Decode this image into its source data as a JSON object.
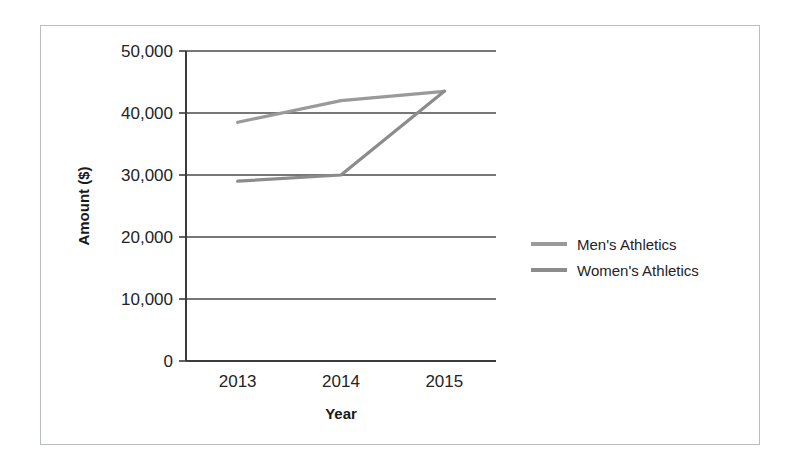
{
  "chart_data": {
    "type": "line",
    "title": "",
    "xlabel": "Year",
    "ylabel": "Amount ($)",
    "categories": [
      "2013",
      "2014",
      "2015"
    ],
    "xtick_labels": [
      "2013",
      "2014",
      "2015"
    ],
    "ytick_labels": [
      "0",
      "10,000",
      "20,000",
      "30,000",
      "40,000",
      "50,000"
    ],
    "ytick_values": [
      0,
      10000,
      20000,
      30000,
      40000,
      50000
    ],
    "ylim": [
      0,
      50000
    ],
    "grid": "horizontal",
    "legend_position": "right",
    "series": [
      {
        "name": "Men's Athletics",
        "values": [
          38500,
          42000,
          43500
        ],
        "color": "#9a9a9a"
      },
      {
        "name": "Women's Athletics",
        "values": [
          29000,
          30000,
          43500
        ],
        "color": "#8c8c8c"
      }
    ]
  },
  "legend": {
    "items": [
      {
        "label": "Men's Athletics"
      },
      {
        "label": "Women's Athletics"
      }
    ]
  },
  "colors": {
    "men_line": "#9a9a9a",
    "women_line": "#8c8c8c",
    "axis": "#3c3c3c",
    "gridline": "#4a4a4a",
    "border": "#b9bcc0",
    "text": "#242424"
  }
}
